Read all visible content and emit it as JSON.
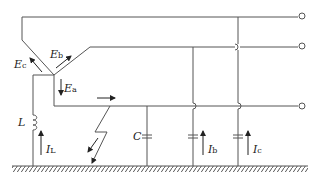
{
  "diagram": {
    "type": "circuit",
    "labels": {
      "Ec": {
        "main": "E",
        "sub": "c"
      },
      "Eb": {
        "main": "E",
        "sub": "b"
      },
      "Ea": {
        "main": "E",
        "sub": "a"
      },
      "L": "L",
      "IL": {
        "main": "I",
        "sub": "L"
      },
      "C": "C",
      "Ib": {
        "main": "I",
        "sub": "b"
      },
      "Ic": {
        "main": "I",
        "sub": "c"
      }
    },
    "terminals": 3,
    "colors": {
      "wire": "#555555",
      "text": "#222222",
      "background": "#ffffff"
    }
  }
}
